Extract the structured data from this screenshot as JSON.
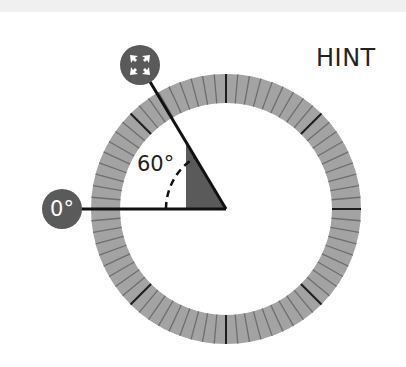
{
  "hint": {
    "label": "HINT"
  },
  "angle": {
    "value": 60,
    "label": "60°"
  },
  "handles": {
    "zero": {
      "label": "0°"
    },
    "rotate": {
      "icon": "move-arrows-icon"
    }
  },
  "dial": {
    "center": [
      226,
      209
    ],
    "outer_radius": 135,
    "inner_radius": 106,
    "tick_count": 72,
    "major_every": 9,
    "colors": {
      "ring": "#a3a3a3",
      "tick": "#6e6e6e",
      "major_tick": "#1e1e1e",
      "wedge": "#5a5a5a",
      "handle": "#5a5a5a",
      "line": "#111111"
    }
  }
}
